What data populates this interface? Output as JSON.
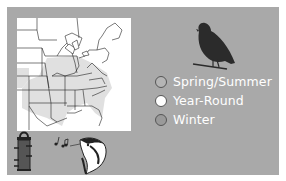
{
  "colors": {
    "panel_bg": "#a9a9a9",
    "map_bg": "#ffffff",
    "range_fill": "#e0e0e0",
    "silhouette": "#2b2b2b",
    "label_text": "#ffffff"
  },
  "map": {
    "region": "Eastern United States range map"
  },
  "legend": {
    "items": [
      {
        "label": "Spring/Summer",
        "swatch": "#b5b5b5"
      },
      {
        "label": "Year-Round",
        "swatch": "#ffffff"
      },
      {
        "label": "Winter",
        "swatch": "#9a9a9a"
      }
    ]
  },
  "icons": {
    "bird": "bird-silhouette-icon",
    "feeder": "tube-feeder-icon",
    "song": "song-notes-icon",
    "woodpecker": "woodpecker-head-icon"
  }
}
